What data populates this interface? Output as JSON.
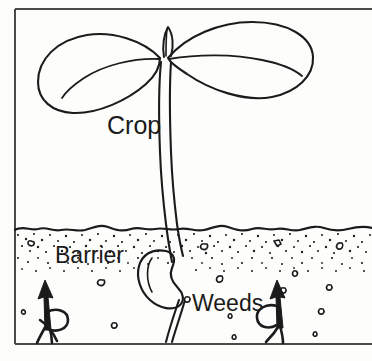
{
  "figure": {
    "background_color": "#fdfdfc",
    "ink_color": "#1b1b1b",
    "frame_color": "#4a4a4a",
    "caption": "",
    "labels": {
      "crop": "Crop",
      "barrier": "Barrier",
      "weeds": "Weeds"
    },
    "parts": {
      "crop_leaf_left": "crop-cotyledon-left",
      "crop_leaf_right": "crop-cotyledon-right",
      "crop_shoot_tip": "crop-shoot-tip",
      "crop_stem": "crop-stem",
      "crop_seed": "crop-seed",
      "crop_root": "crop-taproot",
      "soil_surface": "soil-surface-line",
      "barrier_band": "barrier-stipple-band",
      "weed_left": "weed-seedling-left",
      "weed_right": "weed-seedling-right",
      "arrow_left": "weed-growth-arrow-left",
      "arrow_right": "weed-growth-arrow-right"
    }
  }
}
